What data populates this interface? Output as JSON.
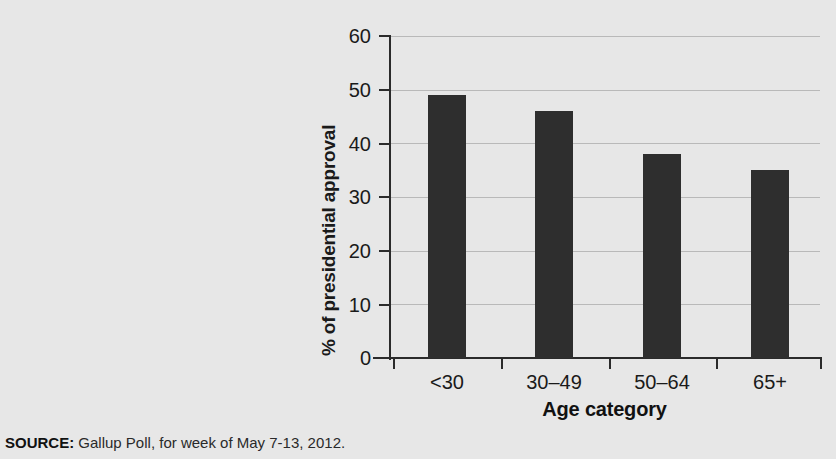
{
  "chart_data": {
    "type": "bar",
    "title": "",
    "subtitle": "",
    "xlabel": "Age category",
    "ylabel": "% of presidential approval",
    "categories": [
      "<30",
      "30–49",
      "50–64",
      "65+"
    ],
    "values": [
      49,
      46,
      38,
      35
    ],
    "series": [
      {
        "name": "% of presidential approval",
        "values": [
          49,
          46,
          38,
          35
        ]
      }
    ],
    "ylim": [
      0,
      60
    ],
    "yticks": [
      0,
      10,
      20,
      30,
      40,
      50,
      60
    ],
    "ytick_labels": [
      "0",
      "10",
      "20",
      "30",
      "40",
      "50",
      "60"
    ],
    "grid": true,
    "grid_axis": "y",
    "legend": false,
    "legend_position": "none",
    "bar_color": "#2e2e2e",
    "background_color": "#e7e7e7",
    "axis_color": "#2b2b2b",
    "gridline_color": "#b9b9b9",
    "annotations": []
  },
  "axes": {
    "y_title": "% of presidential approval",
    "x_title": "Age category"
  },
  "source": {
    "label": "SOURCE:",
    "text": " Gallup Poll, for week of May 7-13, 2012."
  }
}
